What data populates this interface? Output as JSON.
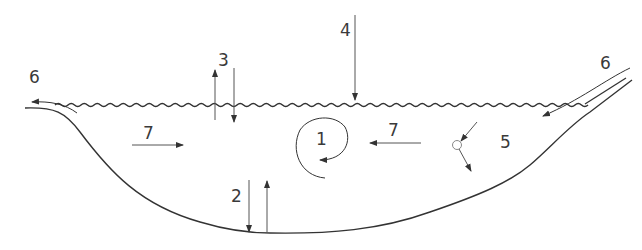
{
  "diagram": {
    "type": "lake cross-section process diagram",
    "colors": {
      "line": "#333333",
      "label": "#3a3a3a",
      "background": "#ffffff"
    },
    "labels": [
      {
        "id": "1",
        "text": "1",
        "meaning": "circulation / eddy",
        "x": 322,
        "y": 145
      },
      {
        "id": "2",
        "text": "2",
        "meaning": "exchange with bottom sediment (down and up arrows)",
        "x": 237,
        "y": 201
      },
      {
        "id": "3",
        "text": "3",
        "meaning": "exchange at water surface (up and down arrows)",
        "x": 223,
        "y": 66
      },
      {
        "id": "4",
        "text": "4",
        "meaning": "input from above (atmospheric)",
        "x": 346,
        "y": 36
      },
      {
        "id": "5",
        "text": "5",
        "meaning": "particle deflection / settling",
        "x": 507,
        "y": 149
      },
      {
        "id": "6a",
        "text": "6",
        "meaning": "outflow at left",
        "x": 36,
        "y": 83
      },
      {
        "id": "6b",
        "text": "6",
        "meaning": "inflow at right",
        "x": 606,
        "y": 69
      },
      {
        "id": "7a",
        "text": "7",
        "meaning": "horizontal flow rightward",
        "x": 148,
        "y": 140
      },
      {
        "id": "7b",
        "text": "7",
        "meaning": "horizontal flow leftward",
        "x": 394,
        "y": 137
      }
    ]
  }
}
